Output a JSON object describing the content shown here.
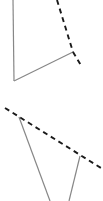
{
  "canvas": {
    "width": 103,
    "height": 201,
    "background_color": "#ffffff",
    "description": "Abstract two-part line drawing: upper chevron figure and lower triangular figure, each combining solid gray strokes with black dashed strokes"
  },
  "styles": {
    "solid_color": "#878787",
    "solid_width": 1.2,
    "dashed_color": "#1a1a1a",
    "dashed_width": 1.9,
    "dash_pattern": "5 4"
  },
  "figures": [
    {
      "id": "upper-figure",
      "name": "upper-chevron-figure",
      "solid_paths": [
        {
          "name": "upper-left-vertical-edge",
          "points": "13,0 14,81",
          "style": "solid"
        },
        {
          "name": "upper-lower-diagonal-edge",
          "points": "14,81 73,52",
          "style": "solid"
        }
      ],
      "dashed_paths": [
        {
          "name": "upper-long-dashed-edge",
          "points": "57,0 73,52",
          "style": "dashed"
        },
        {
          "name": "upper-short-dashed-tail",
          "points": "73,52 82,67",
          "style": "dashed"
        }
      ]
    },
    {
      "id": "lower-figure",
      "name": "lower-triangle-figure",
      "solid_paths": [
        {
          "name": "lower-left-edge",
          "points": "19,117 50,201",
          "style": "solid"
        },
        {
          "name": "lower-right-edge",
          "points": "80,156 69,201",
          "style": "solid"
        }
      ],
      "dashed_paths": [
        {
          "name": "lower-long-dashed-edge",
          "points": "5,108 101,168",
          "style": "dashed"
        }
      ]
    }
  ]
}
